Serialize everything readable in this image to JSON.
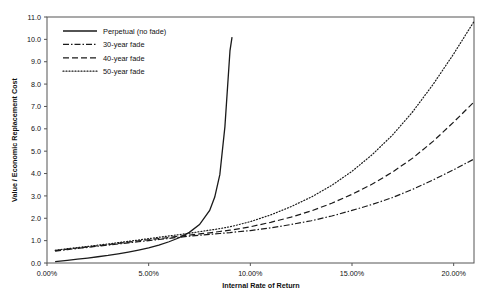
{
  "chart_data": {
    "type": "line",
    "title": "",
    "xlabel": "Internal Rate of Return",
    "ylabel": "Value / Economic Replacement Cost",
    "xlim": [
      0,
      21
    ],
    "ylim": [
      0,
      11
    ],
    "xticks": [
      0,
      5,
      10,
      15,
      20
    ],
    "xticklabels": [
      "0.00%",
      "5.00%",
      "10.00%",
      "15.00%",
      "20.00%"
    ],
    "yticks": [
      0,
      1,
      2,
      3,
      4,
      5,
      6,
      7,
      8,
      9,
      10,
      11
    ],
    "yticklabels": [
      "0.0",
      "1.0",
      "2.0",
      "3.0",
      "4.0",
      "5.0",
      "6.0",
      "7.0",
      "8.0",
      "9.0",
      "10.0",
      "11.0"
    ],
    "grid": false,
    "legend_position": "upper-left",
    "x": [
      0.4,
      1,
      1.5,
      2,
      2.5,
      3,
      3.5,
      4,
      4.5,
      5,
      5.5,
      6,
      6.5,
      7,
      7.5,
      8,
      8.25,
      8.5,
      8.75,
      9,
      9.1,
      10,
      11,
      12,
      13,
      14,
      15,
      16,
      17,
      18,
      19,
      20,
      21
    ],
    "series": [
      {
        "name": "Perpetual (no fade)",
        "linestyle": "solid",
        "dasharray": "",
        "values": [
          0.06,
          0.12,
          0.17,
          0.22,
          0.28,
          0.34,
          0.41,
          0.49,
          0.58,
          0.68,
          0.8,
          0.95,
          1.13,
          1.37,
          1.72,
          2.35,
          2.95,
          3.95,
          6.1,
          9.5,
          10.1,
          null,
          null,
          null,
          null,
          null,
          null,
          null,
          null,
          null,
          null,
          null,
          null
        ]
      },
      {
        "name": "30-year fade",
        "linestyle": "dashdot",
        "dasharray": "6,2,1.5,2",
        "values": [
          0.53,
          0.6,
          0.65,
          0.7,
          0.75,
          0.8,
          0.85,
          0.9,
          0.95,
          1.0,
          1.05,
          1.1,
          1.15,
          1.2,
          1.24,
          1.28,
          1.3,
          1.32,
          1.34,
          1.36,
          1.37,
          1.45,
          1.57,
          1.72,
          1.89,
          2.1,
          2.35,
          2.62,
          2.93,
          3.3,
          3.72,
          4.17,
          4.65
        ]
      },
      {
        "name": "40-year fade",
        "linestyle": "dashed",
        "dasharray": "6,3",
        "values": [
          0.55,
          0.62,
          0.67,
          0.72,
          0.77,
          0.82,
          0.88,
          0.93,
          0.99,
          1.04,
          1.09,
          1.14,
          1.2,
          1.25,
          1.3,
          1.35,
          1.38,
          1.41,
          1.44,
          1.47,
          1.48,
          1.62,
          1.82,
          2.05,
          2.33,
          2.67,
          3.07,
          3.53,
          4.07,
          4.7,
          5.45,
          6.3,
          7.2
        ]
      },
      {
        "name": "50-year fade",
        "linestyle": "dotted",
        "dasharray": "1,2",
        "values": [
          0.57,
          0.64,
          0.69,
          0.74,
          0.8,
          0.85,
          0.91,
          0.97,
          1.03,
          1.09,
          1.15,
          1.21,
          1.27,
          1.33,
          1.4,
          1.47,
          1.5,
          1.54,
          1.58,
          1.62,
          1.64,
          1.85,
          2.15,
          2.52,
          2.95,
          3.47,
          4.1,
          4.85,
          5.73,
          6.78,
          8.0,
          9.35,
          10.8
        ]
      }
    ]
  },
  "legend": {
    "items": [
      {
        "label": "Perpetual (no fade)"
      },
      {
        "label": "30-year fade"
      },
      {
        "label": "40-year fade"
      },
      {
        "label": "50-year fade"
      }
    ]
  }
}
